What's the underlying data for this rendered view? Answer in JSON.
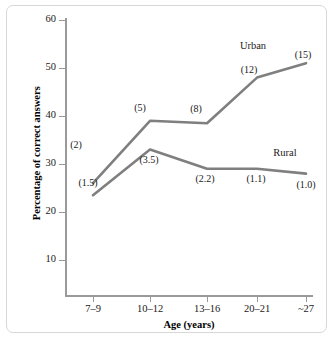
{
  "chart_data": {
    "type": "line",
    "title": "",
    "xlabel": "Age (years)",
    "ylabel": "Percentage of correct answers",
    "categories": [
      "7–9",
      "10–12",
      "13–16",
      "20–21",
      "~27"
    ],
    "ylim": [
      0,
      60
    ],
    "yticks": [
      10,
      20,
      30,
      40,
      50,
      60
    ],
    "grid": false,
    "legend_position": "inline-end-of-line",
    "series": [
      {
        "name": "Urban",
        "values": [
          26,
          39,
          38.5,
          48,
          51
        ],
        "point_labels": [
          "(2)",
          "(5)",
          "(8)",
          "(12)",
          "(15)"
        ],
        "color": "#7f7f7f"
      },
      {
        "name": "Rural",
        "values": [
          23.5,
          33,
          29,
          29,
          28
        ],
        "point_labels": [
          "(1.5)",
          "(3.5)",
          "(2.2)",
          "(1.1)",
          "(1.0)"
        ],
        "color": "#7f7f7f"
      }
    ]
  },
  "axes": {
    "y_tick_labels": [
      "60",
      "50",
      "40",
      "30",
      "20",
      "10"
    ],
    "x_tick_labels": [
      "7–9",
      "10–12",
      "13–16",
      "20–21",
      "~27"
    ],
    "y_title": "Percentage of correct answers",
    "x_title": "Age (years)"
  },
  "annotations": {
    "urban_label": "Urban",
    "rural_label": "Rural",
    "urban_points": [
      "(2)",
      "(5)",
      "(8)",
      "(12)",
      "(15)"
    ],
    "rural_points": [
      "(1.5)",
      "(3.5)",
      "(2.2)",
      "(1.1)",
      "(1.0)"
    ]
  },
  "style": {
    "line_color": "#7f7f7f",
    "axis_color": "#9a9a9a",
    "frame_color": "#d8d8d8",
    "text_color": "#1a1a1a",
    "background": "#ffffff"
  }
}
